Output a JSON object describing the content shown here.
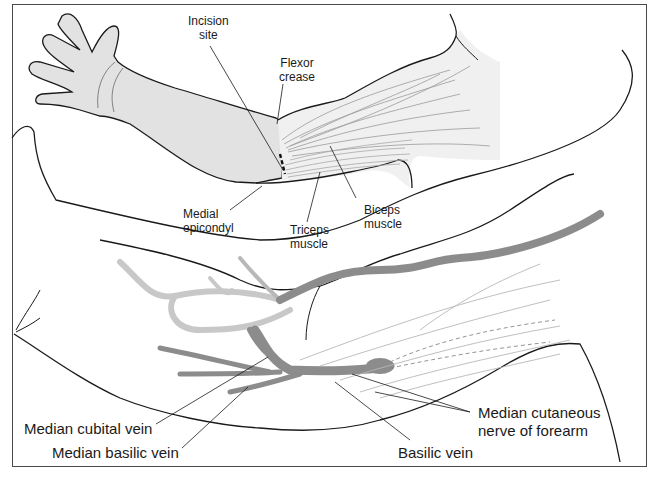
{
  "figure": {
    "upper_panel": {
      "labels": {
        "incision_site": [
          "Incision",
          "site"
        ],
        "flexor_crease": [
          "Flexor",
          "crease"
        ],
        "medial_epicondyl": [
          "Medial",
          "epicondyl"
        ],
        "triceps_muscle": [
          "Triceps",
          "muscle"
        ],
        "biceps_muscle": [
          "Biceps",
          "muscle"
        ]
      }
    },
    "lower_panel": {
      "labels": {
        "median_cubital_vein": "Median cubital vein",
        "median_basilic_vein": "Median basilic vein",
        "basilic_vein": "Basilic vein",
        "median_cutaneous_nerve": [
          "Median cutaneous",
          "nerve of forearm"
        ]
      }
    },
    "colors": {
      "skin_fill": "#e2e2e2",
      "outline": "#1a1a1a",
      "vein_dark": "#8c8c8c",
      "vein_light": "#c4c4c4",
      "muscle_line": "#9a9a9a",
      "frame": "#4a4a4a"
    }
  }
}
